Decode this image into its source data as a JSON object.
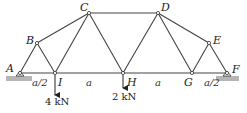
{
  "diagram": {
    "type": "truss",
    "nodes": [
      {
        "id": "A",
        "label": "A",
        "x": 20,
        "y": 73,
        "lx": 6,
        "ly": 72
      },
      {
        "id": "B",
        "label": "B",
        "x": 37,
        "y": 43,
        "lx": 26,
        "ly": 44
      },
      {
        "id": "C",
        "label": "C",
        "x": 89,
        "y": 13,
        "lx": 80,
        "ly": 11
      },
      {
        "id": "D",
        "label": "D",
        "x": 158,
        "y": 13,
        "lx": 161,
        "ly": 11
      },
      {
        "id": "E",
        "label": "E",
        "x": 209,
        "y": 43,
        "lx": 213,
        "ly": 44
      },
      {
        "id": "F",
        "label": "F",
        "x": 227,
        "y": 73,
        "lx": 232,
        "ly": 73
      },
      {
        "id": "G",
        "label": "G",
        "x": 192,
        "y": 73,
        "lx": 184,
        "ly": 86
      },
      {
        "id": "H",
        "label": "H",
        "x": 123,
        "y": 73,
        "lx": 127,
        "ly": 86
      },
      {
        "id": "I",
        "label": "I",
        "x": 55,
        "y": 73,
        "lx": 58,
        "ly": 86
      }
    ],
    "members": [
      [
        "A",
        "B"
      ],
      [
        "B",
        "C"
      ],
      [
        "C",
        "D"
      ],
      [
        "D",
        "E"
      ],
      [
        "E",
        "F"
      ],
      [
        "A",
        "I"
      ],
      [
        "I",
        "H"
      ],
      [
        "H",
        "G"
      ],
      [
        "G",
        "F"
      ],
      [
        "B",
        "I"
      ],
      [
        "I",
        "C"
      ],
      [
        "C",
        "H"
      ],
      [
        "H",
        "D"
      ],
      [
        "D",
        "G"
      ],
      [
        "G",
        "E"
      ]
    ],
    "dimensions": [
      {
        "label": "a/2",
        "x": 32,
        "y": 86
      },
      {
        "label": "a",
        "x": 86,
        "y": 86
      },
      {
        "label": "a",
        "x": 155,
        "y": 86
      },
      {
        "label": "a/2",
        "x": 204,
        "y": 86
      }
    ],
    "loads": [
      {
        "node": "I",
        "label": "4 kN",
        "x": 55,
        "y1": 75,
        "y2": 95,
        "lx": 45,
        "ly": 105
      },
      {
        "node": "H",
        "label": "2 kN",
        "x": 123,
        "y1": 75,
        "y2": 88,
        "lx": 112,
        "ly": 100
      }
    ],
    "supports": [
      {
        "node": "A",
        "type": "pin"
      },
      {
        "node": "F",
        "type": "roller"
      }
    ]
  }
}
